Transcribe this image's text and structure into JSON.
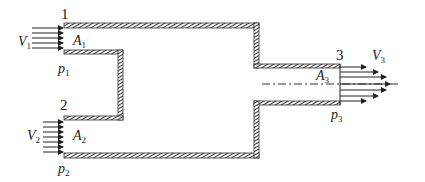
{
  "diagram": {
    "type": "fluid-junction-control-volume",
    "sections": [
      {
        "id": "1",
        "label": "1",
        "velocity": "V",
        "velocity_sub": "1",
        "area": "A",
        "area_sub": "1",
        "pressure": "p",
        "pressure_sub": "1"
      },
      {
        "id": "2",
        "label": "2",
        "velocity": "V",
        "velocity_sub": "2",
        "area": "A",
        "area_sub": "2",
        "pressure": "p",
        "pressure_sub": "2"
      },
      {
        "id": "3",
        "label": "3",
        "velocity": "V",
        "velocity_sub": "3",
        "area": "A",
        "area_sub": "3",
        "pressure": "p",
        "pressure_sub": "3"
      }
    ],
    "colors": {
      "wall": "#333333",
      "text": "#222222",
      "background": "#ffffff"
    }
  }
}
